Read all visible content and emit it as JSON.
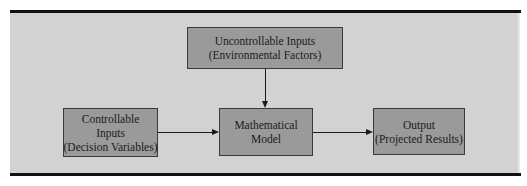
{
  "diagram": {
    "title": "",
    "nodes": {
      "uncontrollable": {
        "line1": "Uncontrollable Inputs",
        "line2": "(Environmental Factors)"
      },
      "controllable": {
        "line1": "Controllable",
        "line2": "Inputs",
        "line3": "(Decision Variables)"
      },
      "model": {
        "line1": "Mathematical",
        "line2": "Model"
      },
      "output": {
        "line1": "Output",
        "line2": "(Projected Results)"
      }
    },
    "edges": [
      {
        "from": "Uncontrollable Inputs (Environmental Factors)",
        "to": "Mathematical Model"
      },
      {
        "from": "Controllable Inputs (Decision Variables)",
        "to": "Mathematical Model"
      },
      {
        "from": "Mathematical Model",
        "to": "Output (Projected Results)"
      }
    ],
    "colors": {
      "background": "#d2d2d2",
      "box_fill": "#9a9a9a",
      "rule": "#111111"
    }
  }
}
